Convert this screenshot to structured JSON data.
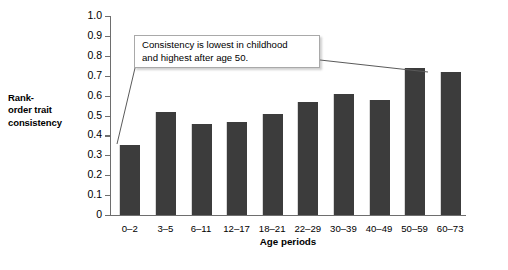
{
  "chart_data": {
    "type": "bar",
    "title": "",
    "xlabel": "Age periods",
    "ylabel": "Rank-order trait consistency",
    "ylabel_lines": [
      "Rank-",
      "order trait",
      "consistency"
    ],
    "categories": [
      "0–2",
      "3–5",
      "6–11",
      "12–17",
      "18–21",
      "22–29",
      "30–39",
      "40–49",
      "50–59",
      "60–73"
    ],
    "values": [
      0.35,
      0.52,
      0.46,
      0.47,
      0.51,
      0.57,
      0.61,
      0.58,
      0.74,
      0.72
    ],
    "ylim": [
      0,
      1.0
    ],
    "ytick_labels": [
      "1.0",
      "0.9",
      "0.8",
      "0.7",
      "0.6",
      "0.5",
      "0.4",
      "0.3",
      "0.2",
      "0.1",
      "0"
    ],
    "ytick_values": [
      1.0,
      0.9,
      0.8,
      0.7,
      0.6,
      0.5,
      0.4,
      0.3,
      0.2,
      0.1,
      0
    ],
    "grid": false,
    "legend": null,
    "bar_color": "#3c3c3c",
    "axis_color": "#6e6e6e",
    "annotations": [
      {
        "id": "consistency-callout",
        "lines": [
          "Consistency is lowest in childhood",
          "and highest after age 50."
        ],
        "points_to": [
          "0–2",
          "50–59"
        ]
      }
    ]
  }
}
